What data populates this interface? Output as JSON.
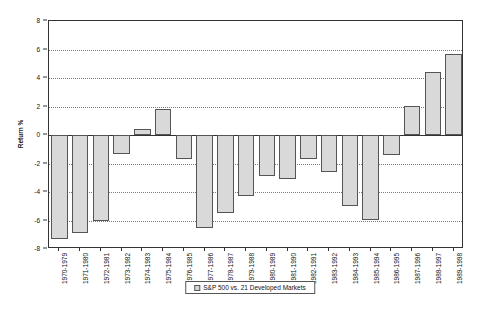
{
  "chart_data": {
    "type": "bar",
    "title": "",
    "xlabel": "",
    "ylabel": "Return %",
    "ylim": [
      -8,
      8
    ],
    "ytick_step": 2,
    "yticks": [
      8,
      6,
      4,
      2,
      0,
      -2,
      -4,
      -6,
      -8
    ],
    "grid": true,
    "legend_position": "bottom-center",
    "categories": [
      "1970-1979",
      "1971-1980",
      "1972-1981",
      "1973-1982",
      "1974-1983",
      "1975-1984",
      "1976-1985",
      "1977-1986",
      "1978-1987",
      "1979-1988",
      "1980-1989",
      "1981-1990",
      "1982-1991",
      "1983-1992",
      "1984-1993",
      "1985-1994",
      "1986-1995",
      "1987-1996",
      "1988-1997",
      "1989-1998"
    ],
    "series": [
      {
        "name": "S&P 500 vs. 21 Developed Markets",
        "color": "#d9d9d9",
        "values": [
          -7.3,
          -6.9,
          -6.0,
          -1.35,
          0.45,
          1.85,
          -1.65,
          -6.5,
          -5.5,
          -4.3,
          -2.9,
          -3.1,
          -1.7,
          -2.6,
          -5.0,
          -5.95,
          -1.4,
          2.05,
          4.45,
          5.7
        ]
      }
    ]
  },
  "legend": {
    "entries": [
      {
        "label": "S&P 500 vs. 21 Developed Markets",
        "swatch_color": "#d9d9d9"
      }
    ]
  },
  "axes": {
    "y_title": "Return %"
  }
}
